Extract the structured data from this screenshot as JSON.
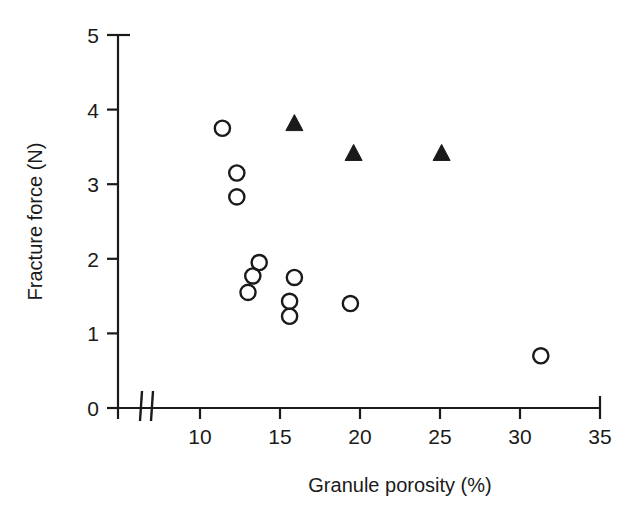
{
  "chart_data": {
    "type": "scatter",
    "title": "",
    "xlabel": "Granule porosity (%)",
    "ylabel": "Fracture force (N)",
    "xlim": [
      5,
      35
    ],
    "ylim": [
      0,
      5
    ],
    "xticks": [
      10,
      15,
      20,
      25,
      30,
      35
    ],
    "yticks": [
      0,
      1,
      2,
      3,
      4,
      5
    ],
    "xtick_labels": [
      "10",
      "15",
      "20",
      "25",
      "30",
      "35"
    ],
    "ytick_labels": [
      "0",
      "1",
      "2",
      "3",
      "4",
      "5"
    ],
    "grid": false,
    "legend": "none",
    "axis_break": {
      "axis": "x",
      "present": true,
      "note": "double slash break between 0 and 10"
    },
    "series": [
      {
        "name": "open-circle",
        "marker": "circle-open",
        "color": "#1a1a1a",
        "points": [
          {
            "x": 11.4,
            "y": 3.75
          },
          {
            "x": 12.3,
            "y": 3.15
          },
          {
            "x": 12.3,
            "y": 2.83
          },
          {
            "x": 13.7,
            "y": 1.95
          },
          {
            "x": 13.3,
            "y": 1.77
          },
          {
            "x": 13.0,
            "y": 1.55
          },
          {
            "x": 15.9,
            "y": 1.75
          },
          {
            "x": 15.6,
            "y": 1.43
          },
          {
            "x": 15.6,
            "y": 1.23
          },
          {
            "x": 19.4,
            "y": 1.4
          },
          {
            "x": 31.3,
            "y": 0.7
          }
        ]
      },
      {
        "name": "filled-triangle",
        "marker": "triangle-filled",
        "color": "#1a1a1a",
        "points": [
          {
            "x": 15.9,
            "y": 3.8
          },
          {
            "x": 19.6,
            "y": 3.4
          },
          {
            "x": 25.1,
            "y": 3.4
          }
        ]
      }
    ]
  }
}
